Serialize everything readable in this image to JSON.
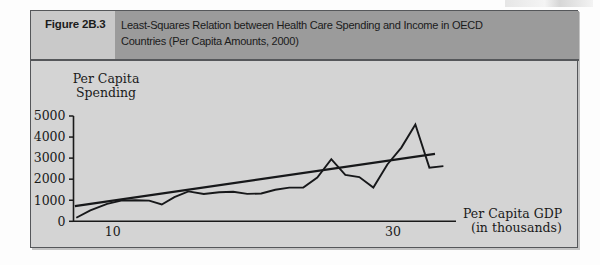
{
  "figure": {
    "number_label": "Figure 2B.3",
    "title": "Least-Squares Relation between Health Care Spending and Income in OECD Countries (Per Capita Amounts, 2000)",
    "title_line1": "Least-Squares Relation between Health Care Spending and Income in OECD",
    "title_line2": "Countries (Per Capita Amounts, 2000)",
    "colors": {
      "panel_background": "#d4d4d4",
      "number_box": "#c9c9c9",
      "title_band": "#9b9b9b",
      "border": "#55575a",
      "ink": "#1a1a1a"
    }
  },
  "chart_data": {
    "type": "line",
    "title": "Least-Squares Relation between Health Care Spending and Income in OECD Countries (Per Capita Amounts, 2000)",
    "xlabel": "Per Capita GDP",
    "xlabel_sub": "(in thousands)",
    "ylabel": "Per Capita",
    "ylabel_sub": "Spending",
    "xlim": [
      7.2,
      34.5
    ],
    "ylim": [
      0,
      5000
    ],
    "grid": false,
    "legend": "none",
    "yticks": [
      0,
      1000,
      2000,
      3000,
      4000,
      5000
    ],
    "ytick_labels": [
      "0",
      "1000",
      "2000",
      "3000",
      "4000",
      "5000"
    ],
    "xticks": [
      10,
      30
    ],
    "xtick_labels": [
      "10",
      "30"
    ],
    "series": [
      {
        "name": "Per capita health spending (OECD countries, sorted by GDP)",
        "style": "jagged-line",
        "x": [
          7.4,
          8.4,
          9.6,
          10.6,
          11.6,
          12.6,
          13.5,
          14.4,
          15.4,
          16.5,
          17.6,
          18.6,
          19.6,
          20.6,
          21.6,
          22.6,
          23.6,
          24.6,
          25.6,
          26.6,
          27.6,
          28.6,
          29.6,
          30.6,
          31.6,
          32.6,
          33.6
        ],
        "y": [
          170,
          520,
          830,
          980,
          1000,
          980,
          800,
          1150,
          1420,
          1300,
          1380,
          1400,
          1300,
          1320,
          1500,
          1600,
          1600,
          2080,
          2950,
          2200,
          2100,
          1600,
          2700,
          3500,
          4600,
          2550,
          2620
        ]
      },
      {
        "name": "Least-squares regression line",
        "style": "straight-line",
        "x": [
          7.3,
          33.0
        ],
        "y": [
          720,
          3200
        ]
      }
    ]
  }
}
